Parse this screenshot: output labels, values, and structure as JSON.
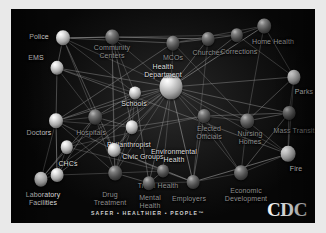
{
  "poster": {
    "title": "Public Health System Network",
    "tagline": "SAFER • HEALTHIER • PEOPLE™",
    "logo": "CDC",
    "background_color": "#0b0b0b",
    "edge_color": "#9a9a9a",
    "label_color": "#c9c9c9"
  },
  "graph": {
    "type": "network",
    "node_count": 24,
    "nodes": [
      {
        "id": "police",
        "label": "Police",
        "x": 52,
        "y": 29,
        "r": 7.0,
        "shade": "light",
        "label_x": 28,
        "label_y": 28
      },
      {
        "id": "ems",
        "label": "EMS",
        "x": 46,
        "y": 59,
        "r": 6.5,
        "shade": "light",
        "label_x": 25,
        "label_y": 49
      },
      {
        "id": "community",
        "label": "Community\nCenters",
        "x": 101,
        "y": 28,
        "r": 6.8,
        "shade": "dark",
        "label_x": 101,
        "label_y": 43
      },
      {
        "id": "mcos",
        "label": "MCOs",
        "x": 162,
        "y": 34,
        "r": 6.6,
        "shade": "dark",
        "label_x": 162,
        "label_y": 49
      },
      {
        "id": "churches",
        "label": "Churches",
        "x": 197,
        "y": 30,
        "r": 6.4,
        "shade": "dark",
        "label_x": 197,
        "label_y": 44
      },
      {
        "id": "corrections",
        "label": "Corrections",
        "x": 226,
        "y": 26,
        "r": 6.2,
        "shade": "dark",
        "label_x": 228,
        "label_y": 43
      },
      {
        "id": "homehealth",
        "label": "Home Health",
        "x": 253,
        "y": 17,
        "r": 6.8,
        "shade": "dark",
        "label_x": 262,
        "label_y": 33
      },
      {
        "id": "healthdept",
        "label": "Health\nDepartment",
        "x": 160,
        "y": 78,
        "r": 11.5,
        "shade": "light",
        "label_x": 152,
        "label_y": 62
      },
      {
        "id": "schools",
        "label": "Schools",
        "x": 124,
        "y": 84,
        "r": 6.0,
        "shade": "light",
        "label_x": 123,
        "label_y": 95
      },
      {
        "id": "parks",
        "label": "Parks",
        "x": 283,
        "y": 68,
        "r": 6.6,
        "shade": "light",
        "label_x": 293,
        "label_y": 83
      },
      {
        "id": "doctors",
        "label": "Doctors",
        "x": 45,
        "y": 112,
        "r": 7.0,
        "shade": "light",
        "label_x": 28,
        "label_y": 124
      },
      {
        "id": "hospitals",
        "label": "Hospitals",
        "x": 84,
        "y": 108,
        "r": 6.8,
        "shade": "dark",
        "label_x": 80,
        "label_y": 124
      },
      {
        "id": "philanthropist",
        "label": "Philanthropist",
        "x": 121,
        "y": 118,
        "r": 6.2,
        "shade": "light",
        "label_x": 118,
        "label_y": 136
      },
      {
        "id": "civicgroups",
        "label": "Civic Groups",
        "x": 103,
        "y": 141,
        "r": 6.4,
        "shade": "light",
        "label_x": 132,
        "label_y": 148
      },
      {
        "id": "electedoff",
        "label": "Elected\nOfficials",
        "x": 193,
        "y": 107,
        "r": 6.4,
        "shade": "dark",
        "label_x": 198,
        "label_y": 124
      },
      {
        "id": "nursinghomes",
        "label": "Nursing\nHomes",
        "x": 236,
        "y": 112,
        "r": 6.8,
        "shade": "dark",
        "label_x": 239,
        "label_y": 129
      },
      {
        "id": "masstransit",
        "label": "Mass Transit",
        "x": 278,
        "y": 104,
        "r": 6.4,
        "shade": "dark",
        "label_x": 283,
        "label_y": 122
      },
      {
        "id": "envhealth",
        "label": "Environmental\nHealth",
        "x": 56,
        "y": 138,
        "r": 6.2,
        "shade": "light",
        "label_x": 163,
        "label_y": 147
      },
      {
        "id": "fire",
        "label": "Fire",
        "x": 277,
        "y": 145,
        "r": 7.4,
        "shade": "light",
        "label_x": 285,
        "label_y": 160
      },
      {
        "id": "chcs",
        "label": "CHCs",
        "x": 46,
        "y": 166,
        "r": 6.4,
        "shade": "light",
        "label_x": 57,
        "label_y": 155
      },
      {
        "id": "labfacilities",
        "label": "Laboratory\nFacilities",
        "x": 30,
        "y": 170,
        "r": 6.6,
        "shade": "light",
        "label_x": 32,
        "label_y": 190
      },
      {
        "id": "drugtreatment",
        "label": "Drug\nTreatment",
        "x": 104,
        "y": 164,
        "r": 6.8,
        "shade": "dark",
        "label_x": 99,
        "label_y": 190
      },
      {
        "id": "tribalhealth",
        "label": "Tribal Health",
        "x": 152,
        "y": 162,
        "r": 6.0,
        "shade": "dark",
        "label_x": 147,
        "label_y": 177
      },
      {
        "id": "mentalhealth",
        "label": "Mental\nHealth",
        "x": 138,
        "y": 174,
        "r": 6.2,
        "shade": "dark",
        "label_x": 139,
        "label_y": 193
      },
      {
        "id": "employers",
        "label": "Employers",
        "x": 182,
        "y": 173,
        "r": 6.4,
        "shade": "dark",
        "label_x": 178,
        "label_y": 190
      },
      {
        "id": "econdev",
        "label": "Economic\nDevelopment",
        "x": 230,
        "y": 164,
        "r": 7.0,
        "shade": "dark",
        "label_x": 235,
        "label_y": 186
      }
    ],
    "edges": [
      [
        "police",
        "community"
      ],
      [
        "police",
        "healthdept"
      ],
      [
        "police",
        "schools"
      ],
      [
        "police",
        "mcos"
      ],
      [
        "police",
        "hospitals"
      ],
      [
        "police",
        "ems"
      ],
      [
        "police",
        "civicgroups"
      ],
      [
        "police",
        "corrections"
      ],
      [
        "ems",
        "hospitals"
      ],
      [
        "ems",
        "doctors"
      ],
      [
        "ems",
        "healthdept"
      ],
      [
        "ems",
        "schools"
      ],
      [
        "ems",
        "fire"
      ],
      [
        "community",
        "schools"
      ],
      [
        "community",
        "healthdept"
      ],
      [
        "community",
        "churches"
      ],
      [
        "community",
        "civicgroups"
      ],
      [
        "community",
        "drugtreatment"
      ],
      [
        "community",
        "philanthropist"
      ],
      [
        "mcos",
        "healthdept"
      ],
      [
        "mcos",
        "churches"
      ],
      [
        "mcos",
        "doctors"
      ],
      [
        "mcos",
        "nursinghomes"
      ],
      [
        "mcos",
        "homehealth"
      ],
      [
        "churches",
        "healthdept"
      ],
      [
        "churches",
        "corrections"
      ],
      [
        "churches",
        "employers"
      ],
      [
        "corrections",
        "healthdept"
      ],
      [
        "corrections",
        "homehealth"
      ],
      [
        "corrections",
        "parks"
      ],
      [
        "homehealth",
        "healthdept"
      ],
      [
        "homehealth",
        "nursinghomes"
      ],
      [
        "homehealth",
        "parks"
      ],
      [
        "healthdept",
        "schools"
      ],
      [
        "healthdept",
        "hospitals"
      ],
      [
        "healthdept",
        "doctors"
      ],
      [
        "healthdept",
        "philanthropist"
      ],
      [
        "healthdept",
        "civicgroups"
      ],
      [
        "healthdept",
        "electedoff"
      ],
      [
        "healthdept",
        "nursinghomes"
      ],
      [
        "healthdept",
        "masstransit"
      ],
      [
        "healthdept",
        "fire"
      ],
      [
        "healthdept",
        "parks"
      ],
      [
        "healthdept",
        "envhealth"
      ],
      [
        "healthdept",
        "tribalhealth"
      ],
      [
        "healthdept",
        "employers"
      ],
      [
        "healthdept",
        "econdev"
      ],
      [
        "healthdept",
        "drugtreatment"
      ],
      [
        "healthdept",
        "mentalhealth"
      ],
      [
        "healthdept",
        "labfacilities"
      ],
      [
        "healthdept",
        "chcs"
      ],
      [
        "schools",
        "hospitals"
      ],
      [
        "schools",
        "philanthropist"
      ],
      [
        "schools",
        "drugtreatment"
      ],
      [
        "schools",
        "doctors"
      ],
      [
        "schools",
        "mentalhealth"
      ],
      [
        "parks",
        "masstransit"
      ],
      [
        "parks",
        "nursinghomes"
      ],
      [
        "parks",
        "fire"
      ],
      [
        "doctors",
        "hospitals"
      ],
      [
        "doctors",
        "chcs"
      ],
      [
        "doctors",
        "labfacilities"
      ],
      [
        "doctors",
        "philanthropist"
      ],
      [
        "doctors",
        "civicgroups"
      ],
      [
        "doctors",
        "drugtreatment"
      ],
      [
        "hospitals",
        "philanthropist"
      ],
      [
        "hospitals",
        "chcs"
      ],
      [
        "hospitals",
        "drugtreatment"
      ],
      [
        "hospitals",
        "civicgroups"
      ],
      [
        "hospitals",
        "labfacilities"
      ],
      [
        "philanthropist",
        "civicgroups"
      ],
      [
        "philanthropist",
        "drugtreatment"
      ],
      [
        "philanthropist",
        "electedoff"
      ],
      [
        "civicgroups",
        "tribalhealth"
      ],
      [
        "civicgroups",
        "drugtreatment"
      ],
      [
        "civicgroups",
        "employers"
      ],
      [
        "electedoff",
        "nursinghomes"
      ],
      [
        "electedoff",
        "econdev"
      ],
      [
        "electedoff",
        "employers"
      ],
      [
        "electedoff",
        "envhealth"
      ],
      [
        "electedoff",
        "masstransit"
      ],
      [
        "nursinghomes",
        "masstransit"
      ],
      [
        "nursinghomes",
        "fire"
      ],
      [
        "nursinghomes",
        "econdev"
      ],
      [
        "masstransit",
        "fire"
      ],
      [
        "masstransit",
        "econdev"
      ],
      [
        "envhealth",
        "chcs"
      ],
      [
        "envhealth",
        "labfacilities"
      ],
      [
        "envhealth",
        "tribalhealth"
      ],
      [
        "fire",
        "econdev"
      ],
      [
        "fire",
        "employers"
      ],
      [
        "chcs",
        "labfacilities"
      ],
      [
        "chcs",
        "drugtreatment"
      ],
      [
        "drugtreatment",
        "mentalhealth"
      ],
      [
        "drugtreatment",
        "tribalhealth"
      ],
      [
        "tribalhealth",
        "mentalhealth"
      ],
      [
        "tribalhealth",
        "employers"
      ],
      [
        "mentalhealth",
        "employers"
      ],
      [
        "employers",
        "econdev"
      ]
    ]
  }
}
